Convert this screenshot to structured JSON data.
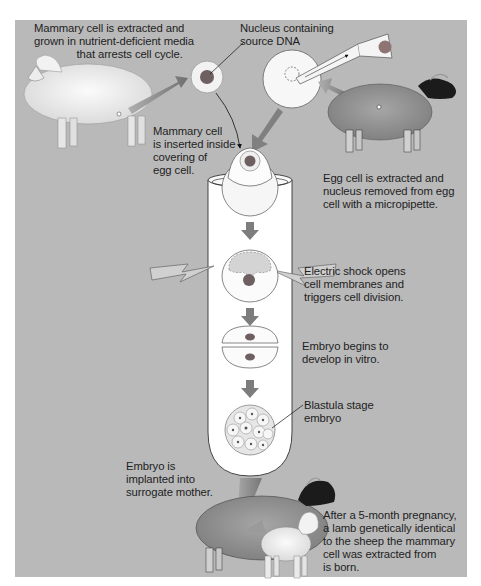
{
  "diagram": {
    "type": "process-flow",
    "topic": "Somatic cell nuclear transfer (sheep cloning)",
    "colors": {
      "background": "#b9b9b9",
      "cell_white": "#f7f7f7",
      "nucleus": "#6e5f60",
      "arrow": "#7c7c7c",
      "text": "#1e1e1e"
    },
    "labels": {
      "mammary_extracted": "Mammary cell is extracted and\ngrown in nutrient-deficient media\n              that arrests cell cycle.",
      "nucleus_source": "Nucleus containing\nsource DNA",
      "mammary_inserted": "Mammary cell\nis inserted inside\ncovering of\negg cell.",
      "egg_extracted": "Egg cell is extracted and\nnucleus removed from egg\ncell with a micropipette.",
      "electric_shock": "Electric shock opens\ncell membranes and\ntriggers cell division.",
      "embryo_develops": "Embryo begins to\ndevelop in vitro.",
      "blastula": "Blastula stage\nembryo",
      "implanted": "Embryo is\nimplanted into\nsurrogate mother.",
      "born": "After a 5-month pregnancy,\na lamb genetically identical\nto the sheep the mammary\ncell was extracted from\nis born."
    },
    "nodes": [
      {
        "id": "donor-sheep",
        "name": "White-faced donor sheep"
      },
      {
        "id": "mammary-cell",
        "name": "Mammary cell"
      },
      {
        "id": "egg-cell",
        "name": "Egg cell (enucleated)"
      },
      {
        "id": "egg-donor-sheep",
        "name": "Black-faced egg donor sheep"
      },
      {
        "id": "fused-cell",
        "name": "Mammary cell inside egg covering"
      },
      {
        "id": "shocked-cell",
        "name": "Cell after electric shock"
      },
      {
        "id": "two-cell-embryo",
        "name": "Two-cell embryo"
      },
      {
        "id": "blastula",
        "name": "Blastula stage embryo"
      },
      {
        "id": "surrogate",
        "name": "Surrogate mother"
      },
      {
        "id": "lamb",
        "name": "Cloned lamb"
      }
    ]
  }
}
